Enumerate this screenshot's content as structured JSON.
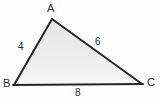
{
  "figure": {
    "type": "triangle-diagram",
    "background_color": "#ffffff",
    "fill_color": "#ededed",
    "stroke_color": "#262626",
    "text_color": "#2b2b2b",
    "vertices": [
      {
        "name": "A",
        "label": "A",
        "x": 52,
        "y": 19
      },
      {
        "name": "B",
        "label": "B",
        "x": 14,
        "y": 85
      },
      {
        "name": "C",
        "label": "C",
        "x": 142,
        "y": 84
      }
    ],
    "sides": [
      {
        "name": "AB",
        "label": "4",
        "from": "A",
        "to": "B"
      },
      {
        "name": "AC",
        "label": "6",
        "from": "A",
        "to": "C"
      },
      {
        "name": "BC",
        "label": "8",
        "from": "B",
        "to": "C"
      }
    ]
  }
}
